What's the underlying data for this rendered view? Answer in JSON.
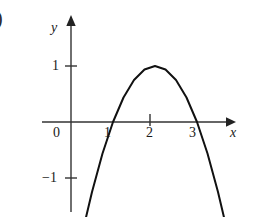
{
  "figure": {
    "fragment_text": ")",
    "background_color": "#ffffff",
    "ink_color": "#1a1a1a"
  },
  "chart_data": {
    "type": "line",
    "title": "",
    "subtitle": "",
    "xlabel": "x",
    "ylabel": "y",
    "equation": "y = -(x - 2)^2 + 1",
    "xlim": [
      -0.7,
      3.95
    ],
    "ylim": [
      -1.75,
      1.85
    ],
    "grid": false,
    "legend": null,
    "axis_arrows": {
      "x": "right",
      "y": "up"
    },
    "origin_label": "0",
    "xticks": [
      1,
      2,
      3
    ],
    "xtick_labels": [
      "1",
      "2",
      "3"
    ],
    "yticks": [
      1,
      -1
    ],
    "ytick_labels": [
      "1",
      "−1"
    ],
    "roots": [
      1,
      3
    ],
    "vertex": {
      "x": 2,
      "y": 1
    },
    "series": [
      {
        "name": "parabola",
        "color": "#111111",
        "linewidth": 2,
        "x": [
          0.32,
          0.5,
          0.75,
          1.0,
          1.25,
          1.5,
          1.75,
          2.0,
          2.25,
          2.5,
          2.75,
          3.0,
          3.25,
          3.5,
          3.68
        ],
        "y": [
          -1.82,
          -1.25,
          -0.5625,
          0.0,
          0.4375,
          0.75,
          0.9375,
          1.0,
          0.9375,
          0.75,
          0.4375,
          0.0,
          -0.5625,
          -1.25,
          -1.82
        ]
      }
    ]
  },
  "labels": {
    "y_axis": "y",
    "x_axis": "x",
    "origin": "0",
    "y_one": "1",
    "y_minus_one": "−1",
    "x_one": "1",
    "x_two": "2",
    "x_three": "3"
  }
}
